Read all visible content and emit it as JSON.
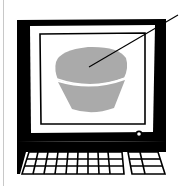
{
  "illustration": {
    "subject": "computer-monitor-with-bowl",
    "alt_text": "Illustration of a computer monitor displaying a gray bowl with a pointer line",
    "colors": {
      "ink": "#000000",
      "paper": "#ffffff",
      "object_fill": "#aaaaaa",
      "edge_line": "#c8c8c8"
    },
    "icons": {
      "monitor": "monitor-icon",
      "bowl": "bowl-icon",
      "pointer": "pointer-line-icon",
      "power_button": "power-button-icon",
      "keyboard": "keyboard-icon"
    }
  }
}
